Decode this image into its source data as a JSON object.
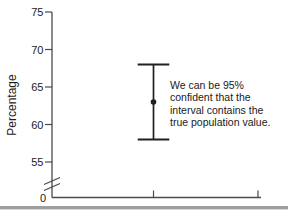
{
  "chart_data": {
    "type": "scatter",
    "title": "",
    "xlabel": "",
    "ylabel": "Percentage",
    "y_ticks": [
      75,
      70,
      65,
      60,
      55
    ],
    "origin_label": "0",
    "axis_break": true,
    "grid": false,
    "legend": "none",
    "series": [
      {
        "name": "95% confidence interval",
        "point_estimate": 63,
        "ci_low": 58,
        "ci_high": 68
      }
    ],
    "annotation_lines": [
      "We can be 95%",
      "confident that the",
      "interval contains the",
      "true population value."
    ],
    "annotation_text": "We can be 95% confident that the interval contains the true population value."
  },
  "colors": {
    "axis": "#4a4a4a",
    "text": "#1c1c1c",
    "interval": "#202020",
    "page_edge": "#9e9e9e",
    "background": "#ffffff"
  }
}
